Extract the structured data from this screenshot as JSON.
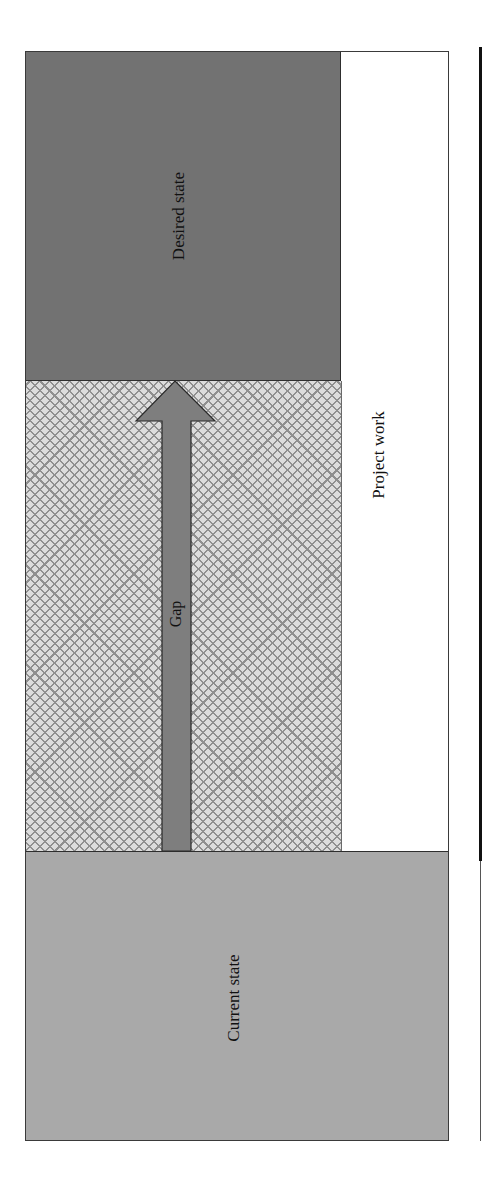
{
  "diagram": {
    "type": "gap-analysis",
    "labels": {
      "desired_state": "Desired state",
      "gap": "Gap",
      "project_work": "Project work",
      "current_state": "Current state"
    },
    "arrow": {
      "direction": "up",
      "from": "current_state",
      "to": "desired_state"
    },
    "colors": {
      "desired_state_fill": "#727272",
      "current_state_fill": "#a9a9a9",
      "gap_fill": "#dcdcdc",
      "gap_hatch": "#8f8f8f",
      "arrow_fill": "#7e7e7e",
      "border": "#2e2e2e",
      "project_work_fill": "#ffffff"
    }
  }
}
